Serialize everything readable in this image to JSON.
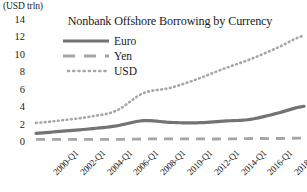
{
  "chart_data": {
    "type": "line",
    "title": "Nonbank Offshore Borrowing by Currency",
    "unit_label": "(USD trln)",
    "xlabel": "",
    "ylabel": "",
    "ylim": [
      0,
      14
    ],
    "yticks": [
      0,
      2,
      4,
      6,
      8,
      10,
      12,
      14
    ],
    "ytick_labels": [
      "0",
      "2",
      "4",
      "6",
      "8",
      "10",
      "12",
      "14"
    ],
    "grid": false,
    "legend_position": "upper-left-inside",
    "x": [
      "2000-Q1",
      "2002-Q1",
      "2004-Q1",
      "2006-Q1",
      "2008-Q1",
      "2010-Q1",
      "2012-Q1",
      "2014-Q1",
      "2016-Q1",
      "2018-Q1",
      "2020-Q1"
    ],
    "xtick_labels": [
      "2000-Q1",
      "2002-Q1",
      "2004-Q1",
      "2006-Q1",
      "2008-Q1",
      "2010-Q1",
      "2012-Q1",
      "2014-Q1",
      "2016-Q1",
      "2018-Q1",
      "2020-Q1"
    ],
    "series": [
      {
        "name": "Euro",
        "style": "solid",
        "color": "#737373",
        "values": [
          1.0,
          1.25,
          1.5,
          1.85,
          2.45,
          2.25,
          2.2,
          2.4,
          2.6,
          3.3,
          4.1
        ]
      },
      {
        "name": "Yen",
        "style": "dashed",
        "color": "#a6a6a6",
        "values": [
          0.3,
          0.3,
          0.3,
          0.3,
          0.35,
          0.35,
          0.35,
          0.35,
          0.4,
          0.4,
          0.45
        ]
      },
      {
        "name": "USD",
        "style": "dotted",
        "color": "#a6a6a6",
        "values": [
          2.2,
          2.5,
          2.9,
          3.6,
          5.6,
          6.2,
          7.2,
          8.4,
          9.5,
          10.8,
          12.2
        ]
      }
    ]
  },
  "legend": {
    "items": [
      {
        "label": "Euro"
      },
      {
        "label": "Yen"
      },
      {
        "label": "USD"
      }
    ]
  }
}
